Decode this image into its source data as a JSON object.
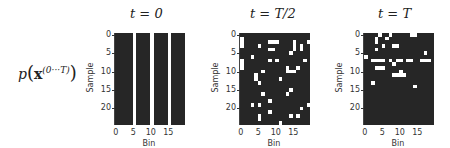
{
  "row_label": {
    "p": "p",
    "x": "x",
    "sup": "(0···T)"
  },
  "chart_data": [
    {
      "type": "heatmap",
      "title": "t = 0",
      "xlabel": "Bin",
      "ylabel": "Sample",
      "xticks": [
        "0",
        "5",
        "10",
        "15"
      ],
      "yticks": [
        "0",
        "5",
        "10",
        "15",
        "20"
      ],
      "shape": [
        25,
        20
      ],
      "colors": {
        "off": "#262626",
        "on": "#ffffff"
      },
      "rows": [
        "00000100001000010000",
        "00000100001000010000",
        "00000100001000010000",
        "00000100001000010000",
        "00000100001000010000",
        "00000100001000010000",
        "00000100001000010000",
        "00000100001000010000",
        "00000100001000010000",
        "00000100001000010000",
        "00000100001000010000",
        "00000100001000010000",
        "00000100001000010000",
        "00000100001000010000",
        "00000100001000010000",
        "00000100001000010000",
        "00000100001000010000",
        "00000100001000010000",
        "00000100001000010000",
        "00000100001000010000",
        "00000100001000010000",
        "00000100001000010000",
        "00000100001000010000",
        "00000100001000010000",
        "00000100001000010000"
      ]
    },
    {
      "type": "heatmap",
      "title": "t = T/2",
      "xlabel": "Bin",
      "ylabel": "Sample",
      "xticks": [
        "0",
        "5",
        "10",
        "15"
      ],
      "yticks": [
        "0",
        "5",
        "10",
        "15",
        "20"
      ],
      "shape": [
        25,
        20
      ],
      "colors": {
        "off": "#262626",
        "on": "#ffffff"
      },
      "rows": [
        "00000000000000000000",
        "10000000000000000000",
        "10000000111000010001",
        "10000100000000010100",
        "00000000110000010100",
        "00000000000000100000",
        "00010000000000000000",
        "10000000101000000010",
        "10000000000000000000",
        "10000000000001001000",
        "00000010000001110000",
        "00001000000000000000",
        "00001000000100000000",
        "00000100000000000000",
        "00000000000000000000",
        "00000000000000100000",
        "00000010000001000000",
        "00000000000000000000",
        "00000000100000000000",
        "00010100000000000001",
        "00000000000000000100",
        "00000000100000000000",
        "00000100000000101000",
        "00000100000000000000",
        "00000000000100000000"
      ]
    },
    {
      "type": "heatmap",
      "title": "t = T",
      "xlabel": "Bin",
      "ylabel": "Sample",
      "xticks": [
        "0",
        "5",
        "10",
        "15"
      ],
      "yticks": [
        "0",
        "5",
        "10",
        "15",
        "20"
      ],
      "shape": [
        25,
        20
      ],
      "colors": {
        "off": "#262626",
        "on": "#ffffff"
      },
      "rows": [
        "00001001000001100000",
        "00010010000000000000",
        "00010000000000000000",
        "00000100110000000000",
        "00010000000000000000",
        "00000000000000000100",
        "10000000000000000000",
        "00111101011011001110",
        "00000000100000000000",
        "00011100000000000000",
        "00000000001000000000",
        "00000000111100000000",
        "00000000000000000000",
        "00100000000000000000",
        "00000000000000100000",
        "00000000000000000000",
        "00000000000000000000",
        "00000000000000000000",
        "00000000000000000000",
        "00000000000000000000",
        "00000000000000000000",
        "00000000000000000000",
        "00000000000000000000",
        "00000000000000000000",
        "00000000000000000000"
      ]
    }
  ]
}
